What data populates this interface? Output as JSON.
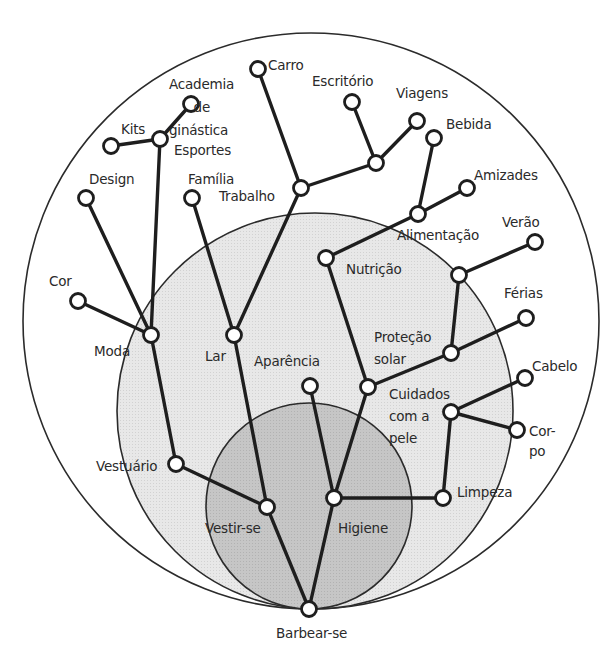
{
  "colors": {
    "outer_fill": "#ffffff",
    "middle_fill": "#e6e6e6",
    "inner_fill": "#c4c4c4",
    "circle_stroke": "#2b2b2b",
    "edge": "#1e1e1e",
    "node_fill": "#ffffff",
    "text": "#2a2a2a"
  },
  "circles": [
    {
      "name": "outer",
      "cx": 311,
      "cy": 321,
      "r": 288
    },
    {
      "name": "middle",
      "cx": 315,
      "cy": 411,
      "r": 198
    },
    {
      "name": "inner",
      "cx": 309,
      "cy": 506,
      "r": 103
    }
  ],
  "nodes": [
    {
      "id": "barbear",
      "x": 309,
      "y": 609
    },
    {
      "id": "vestir",
      "x": 267,
      "y": 507
    },
    {
      "id": "higiene",
      "x": 334,
      "y": 498
    },
    {
      "id": "vestuario",
      "x": 176,
      "y": 464
    },
    {
      "id": "moda",
      "x": 151,
      "y": 335
    },
    {
      "id": "cor",
      "x": 78,
      "y": 301
    },
    {
      "id": "design",
      "x": 86,
      "y": 198
    },
    {
      "id": "esportes",
      "x": 160,
      "y": 139
    },
    {
      "id": "kits",
      "x": 111,
      "y": 146
    },
    {
      "id": "academia",
      "x": 191,
      "y": 104
    },
    {
      "id": "lar",
      "x": 234,
      "y": 335
    },
    {
      "id": "familia",
      "x": 192,
      "y": 198
    },
    {
      "id": "trabalho",
      "x": 301,
      "y": 188
    },
    {
      "id": "carro",
      "x": 258,
      "y": 69
    },
    {
      "id": "hub_trab",
      "x": 376,
      "y": 163
    },
    {
      "id": "escritorio",
      "x": 352,
      "y": 102
    },
    {
      "id": "viagens",
      "x": 417,
      "y": 121
    },
    {
      "id": "aparencia",
      "x": 310,
      "y": 386
    },
    {
      "id": "hub_cuid",
      "x": 368,
      "y": 387
    },
    {
      "id": "nutricao",
      "x": 326,
      "y": 258
    },
    {
      "id": "alimentacao",
      "x": 418,
      "y": 214
    },
    {
      "id": "bebida",
      "x": 434,
      "y": 138
    },
    {
      "id": "amizades",
      "x": 467,
      "y": 188
    },
    {
      "id": "protecao",
      "x": 451,
      "y": 353
    },
    {
      "id": "hub_verao",
      "x": 459,
      "y": 275
    },
    {
      "id": "verao",
      "x": 535,
      "y": 242
    },
    {
      "id": "ferias",
      "x": 526,
      "y": 318
    },
    {
      "id": "limpeza",
      "x": 443,
      "y": 498
    },
    {
      "id": "cuidados",
      "x": 451,
      "y": 412
    },
    {
      "id": "cabelo",
      "x": 525,
      "y": 378
    },
    {
      "id": "corpo",
      "x": 517,
      "y": 430
    }
  ],
  "edges": [
    [
      "barbear",
      "vestir"
    ],
    [
      "barbear",
      "higiene"
    ],
    [
      "vestir",
      "vestuario"
    ],
    [
      "vestir",
      "lar"
    ],
    [
      "vestuario",
      "moda"
    ],
    [
      "moda",
      "cor"
    ],
    [
      "moda",
      "design"
    ],
    [
      "moda",
      "esportes"
    ],
    [
      "esportes",
      "kits"
    ],
    [
      "esportes",
      "academia"
    ],
    [
      "lar",
      "familia"
    ],
    [
      "lar",
      "trabalho"
    ],
    [
      "trabalho",
      "carro"
    ],
    [
      "trabalho",
      "hub_trab"
    ],
    [
      "hub_trab",
      "escritorio"
    ],
    [
      "hub_trab",
      "viagens"
    ],
    [
      "higiene",
      "aparencia"
    ],
    [
      "higiene",
      "hub_cuid"
    ],
    [
      "higiene",
      "limpeza"
    ],
    [
      "hub_cuid",
      "nutricao"
    ],
    [
      "hub_cuid",
      "protecao"
    ],
    [
      "nutricao",
      "alimentacao"
    ],
    [
      "alimentacao",
      "bebida"
    ],
    [
      "alimentacao",
      "amizades"
    ],
    [
      "protecao",
      "hub_verao"
    ],
    [
      "protecao",
      "ferias"
    ],
    [
      "hub_verao",
      "verao"
    ],
    [
      "limpeza",
      "cuidados"
    ],
    [
      "cuidados",
      "cabelo"
    ],
    [
      "cuidados",
      "corpo"
    ]
  ],
  "labels": {
    "carro": "Carro",
    "academia": "Academia\n      de\nginástica",
    "kits": "Kits",
    "esportes": "Esportes",
    "escritorio": "Escritório",
    "viagens": "Viagens",
    "bebida": "Bebida",
    "design": "Design",
    "familia": "Família",
    "trabalho": "Trabalho",
    "amizades": "Amizades",
    "alimentacao": "Alimentação",
    "verao": "Verão",
    "nutricao": "Nutrição",
    "cor": "Cor",
    "ferias": "Férias",
    "moda": "Moda",
    "lar": "Lar",
    "protecao": "Proteção\nsolar",
    "aparencia": "Aparência",
    "cabelo": "Cabelo",
    "cuidados": "Cuidados\ncom a\npele",
    "corpo": "Cor-\npo",
    "vestuario": "Vestuário",
    "limpeza": "Limpeza",
    "vestir": "Vestir-se",
    "higiene": "Higiene",
    "barbear": "Barbear-se"
  }
}
